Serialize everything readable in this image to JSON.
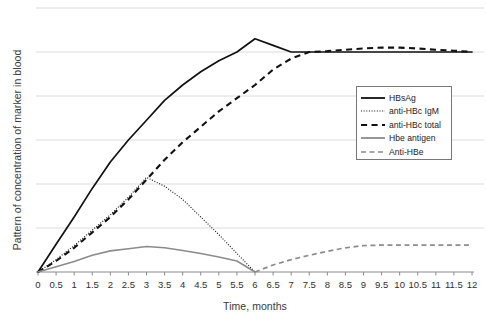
{
  "chart_data": {
    "type": "line",
    "title": "",
    "xlabel": "Time, months",
    "ylabel": "Pattern of concentration of marker in blood",
    "xlim": [
      0,
      12
    ],
    "ylim": [
      0,
      6
    ],
    "grid": true,
    "grid_axis": "y",
    "y_ticks_labeled": false,
    "legend_position": "center-right",
    "xticklabels": [
      "0",
      "0.5",
      "1",
      "1.5",
      "2",
      "2.5",
      "3",
      "3.5",
      "4",
      "4.5",
      "5",
      "5.5",
      "6",
      "6.5",
      "7",
      "7.5",
      "8",
      "8.5",
      "9",
      "9.5",
      "10",
      "10.5",
      "11",
      "11.5",
      "12"
    ],
    "x": [
      0,
      0.5,
      1,
      1.5,
      2,
      2.5,
      3,
      3.5,
      4,
      4.5,
      5,
      5.5,
      6,
      6.5,
      7,
      7.5,
      8,
      8.5,
      9,
      9.5,
      10,
      10.5,
      11,
      11.5,
      12
    ],
    "series": [
      {
        "name": "HBsAg",
        "style": "solid",
        "color": "#111111",
        "width": 1.7,
        "values": [
          0,
          0.63,
          1.25,
          1.9,
          2.5,
          3.0,
          3.45,
          3.9,
          4.25,
          4.55,
          4.8,
          5.0,
          5.3,
          5.15,
          5.0,
          5.0,
          5.0,
          5.0,
          5.0,
          5.0,
          5.0,
          5.0,
          5.0,
          5.0,
          5.0
        ]
      },
      {
        "name": "anti-HBc IgM",
        "style": "dotted",
        "color": "#111111",
        "width": 1.1,
        "values": [
          0,
          0.28,
          0.6,
          0.95,
          1.3,
          1.7,
          2.15,
          1.95,
          1.65,
          1.25,
          0.85,
          0.42,
          0.0,
          null,
          null,
          null,
          null,
          null,
          null,
          null,
          null,
          null,
          null,
          null,
          null
        ]
      },
      {
        "name": "anti-HBc total",
        "style": "dashed",
        "color": "#111111",
        "width": 2.1,
        "values": [
          0,
          0.25,
          0.55,
          0.9,
          1.25,
          1.65,
          2.1,
          2.55,
          2.95,
          3.3,
          3.65,
          3.95,
          4.25,
          4.6,
          4.85,
          5.0,
          5.02,
          5.05,
          5.08,
          5.1,
          5.1,
          5.08,
          5.05,
          5.03,
          5.0
        ]
      },
      {
        "name": "Hbe antigen",
        "style": "solid",
        "color": "#8c8c8c",
        "width": 1.6,
        "values": [
          0,
          0.12,
          0.24,
          0.38,
          0.48,
          0.53,
          0.58,
          0.55,
          0.49,
          0.42,
          0.34,
          0.25,
          0.0,
          null,
          null,
          null,
          null,
          null,
          null,
          null,
          null,
          null,
          null,
          null,
          null
        ]
      },
      {
        "name": "Anti-HBe",
        "style": "dashed",
        "color": "#8c8c8c",
        "width": 1.7,
        "values": [
          null,
          null,
          null,
          null,
          null,
          null,
          null,
          null,
          null,
          null,
          null,
          null,
          0.0,
          0.16,
          0.28,
          0.38,
          0.47,
          0.55,
          0.6,
          0.61,
          0.61,
          0.61,
          0.61,
          0.61,
          0.61
        ]
      }
    ]
  },
  "legend": {
    "entries": [
      {
        "label": "HBsAg"
      },
      {
        "label": "anti-HBc IgM"
      },
      {
        "label": "anti-HBc total"
      },
      {
        "label": "Hbe antigen"
      },
      {
        "label": "Anti-HBe"
      }
    ]
  },
  "axes": {
    "xlabel": "Time, months",
    "ylabel": "Pattern of concentration of marker in blood"
  }
}
